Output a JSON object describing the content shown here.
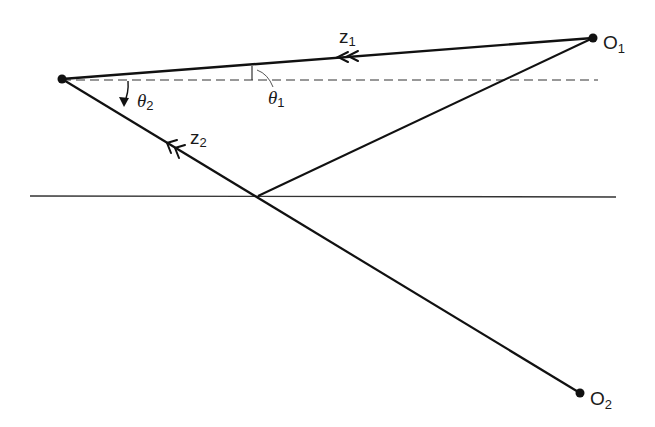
{
  "diagram": {
    "type": "ray-geometry",
    "points": {
      "left_point": {
        "x": 62,
        "y": 79
      },
      "O1": {
        "x": 593,
        "y": 38
      },
      "O2": {
        "x": 580,
        "y": 393
      },
      "reflection_point": {
        "x": 258,
        "y": 196
      }
    },
    "labels": {
      "O1": {
        "main": "O",
        "sub": "1"
      },
      "O2": {
        "main": "O",
        "sub": "2"
      },
      "z1": {
        "main": "z",
        "sub": "1"
      },
      "z2": {
        "main": "z",
        "sub": "2"
      },
      "theta1": {
        "main": "θ",
        "sub": "1"
      },
      "theta2": {
        "main": "θ",
        "sub": "2"
      }
    },
    "lines": [
      {
        "name": "direct-ray-z1",
        "from": "O1",
        "to": "left_point",
        "style": "solid-thick"
      },
      {
        "name": "reflected-ray-incoming",
        "from": "O1",
        "to": "reflection_point",
        "style": "solid"
      },
      {
        "name": "ray-z2",
        "from": "O2",
        "to": "left_point",
        "style": "solid-thick"
      },
      {
        "name": "horizontal-surface",
        "y": 196,
        "x_start": 30,
        "x_end": 616,
        "style": "solid-thin"
      },
      {
        "name": "horizontal-reference",
        "y": 80,
        "x_start": 62,
        "x_end": 598,
        "style": "dashed"
      }
    ],
    "colors": {
      "ink": "#111111",
      "background": "#ffffff"
    }
  }
}
